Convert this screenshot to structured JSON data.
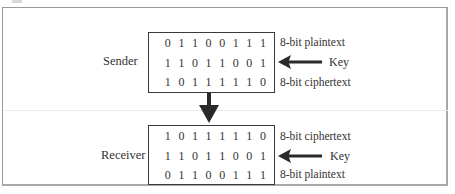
{
  "diagram": {
    "sender": {
      "label": "Sender",
      "rows": [
        {
          "bits": [
            "0",
            "1",
            "1",
            "0",
            "0",
            "1",
            "1",
            "1"
          ],
          "label": "8-bit plaintext"
        },
        {
          "bits": [
            "1",
            "1",
            "0",
            "1",
            "1",
            "0",
            "0",
            "1"
          ],
          "label": "Key"
        },
        {
          "bits": [
            "1",
            "0",
            "1",
            "1",
            "1",
            "1",
            "1",
            "0"
          ],
          "label": "8-bit ciphertext"
        }
      ]
    },
    "receiver": {
      "label": "Receiver",
      "rows": [
        {
          "bits": [
            "1",
            "0",
            "1",
            "1",
            "1",
            "1",
            "1",
            "0"
          ],
          "label": "8-bit ciphertext"
        },
        {
          "bits": [
            "1",
            "1",
            "0",
            "1",
            "1",
            "0",
            "0",
            "1"
          ],
          "label": "Key"
        },
        {
          "bits": [
            "0",
            "1",
            "1",
            "0",
            "0",
            "1",
            "1",
            "1"
          ],
          "label": "8-bit plaintext"
        }
      ]
    },
    "colors": {
      "ink": "#2a2a2a",
      "frame": "#9a9a9a",
      "arrow": "#2a2a2a"
    },
    "icons": {
      "key_arrow": "left-arrow-icon",
      "transfer_arrow": "down-arrow-icon"
    }
  }
}
